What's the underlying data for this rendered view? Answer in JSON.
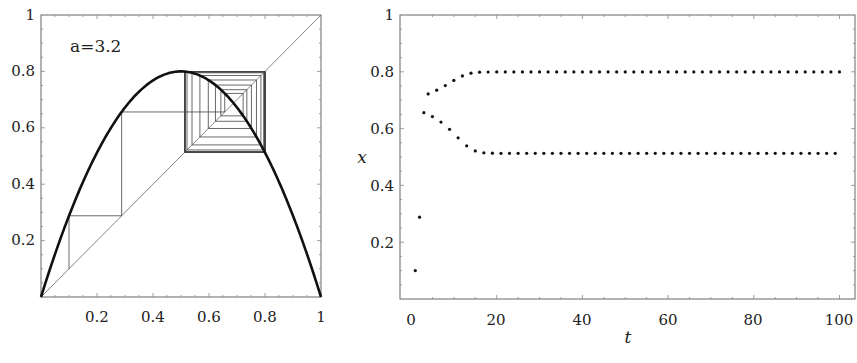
{
  "chart_data": [
    {
      "type": "line",
      "title": "",
      "description": "Cobweb diagram of the logistic map",
      "annotation": "a=3.2",
      "parameter_a": 3.2,
      "initial_x": 0.1,
      "xlabel": "",
      "ylabel": "",
      "xlim": [
        0,
        1
      ],
      "ylim": [
        0,
        1
      ],
      "xticks": [
        "0.2",
        "0.4",
        "0.6",
        "0.8",
        "1"
      ],
      "yticks": [
        "0.2",
        "0.4",
        "0.6",
        "0.8",
        "1"
      ],
      "series": [
        {
          "name": "f(x) = a x (1 - x)",
          "style": "thick"
        },
        {
          "name": "y = x diagonal",
          "style": "thin"
        },
        {
          "name": "cobweb iterations",
          "style": "thin",
          "iterations": 40
        }
      ],
      "grid": false
    },
    {
      "type": "scatter",
      "title": "",
      "xlabel": "t",
      "ylabel": "x",
      "xlim": [
        0,
        100
      ],
      "ylim": [
        0,
        1
      ],
      "xticks": [
        "0",
        "20",
        "40",
        "60",
        "80",
        "100"
      ],
      "yticks": [
        "0.2",
        "0.4",
        "0.6",
        "0.8",
        "1"
      ],
      "series": [
        {
          "name": "x_t",
          "t_start": 1,
          "t_end": 100,
          "x0": 0.1,
          "values_first": [
            0.1,
            0.288,
            0.656,
            0.722,
            0.642,
            0.735,
            0.623,
            0.752,
            0.598,
            0.769,
            0.568,
            0.785,
            0.54,
            0.795,
            0.521,
            0.799,
            0.514
          ],
          "steady_state": [
            0.513,
            0.799
          ]
        }
      ],
      "grid": false
    }
  ],
  "labels": {
    "annotation": "a=3.2",
    "right_xlabel": "t",
    "right_ylabel": "x",
    "left_xticks": [
      "0.2",
      "0.4",
      "0.6",
      "0.8",
      "1"
    ],
    "left_yticks": [
      "0.2",
      "0.4",
      "0.6",
      "0.8",
      "1"
    ],
    "right_xticks": [
      "0",
      "20",
      "40",
      "60",
      "80",
      "100"
    ],
    "right_yticks": [
      "0.2",
      "0.4",
      "0.6",
      "0.8",
      "1"
    ]
  }
}
